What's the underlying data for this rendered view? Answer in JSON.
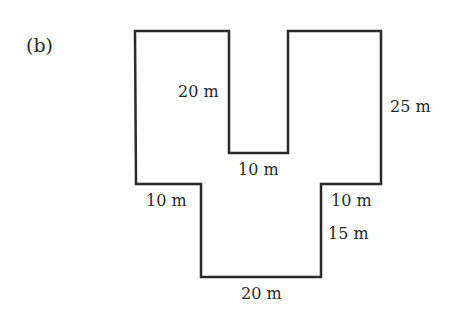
{
  "figure": {
    "part_label": "(b)",
    "shape": "composite rectilinear figure",
    "stroke_color": "#2a2a2a",
    "outline_points": [
      [
        135,
        31
      ],
      [
        229,
        31
      ],
      [
        229,
        153
      ],
      [
        288,
        153
      ],
      [
        288,
        31
      ],
      [
        381,
        31
      ],
      [
        381,
        184
      ],
      [
        321,
        184
      ],
      [
        321,
        277
      ],
      [
        201,
        277
      ],
      [
        201,
        184
      ],
      [
        136,
        184
      ]
    ],
    "dimensions": {
      "notch_depth": "20 m",
      "notch_width": "10 m",
      "right_height": "25 m",
      "left_step": "10 m",
      "right_step": "10 m",
      "lower_height": "15 m",
      "bottom_width": "20 m"
    }
  }
}
